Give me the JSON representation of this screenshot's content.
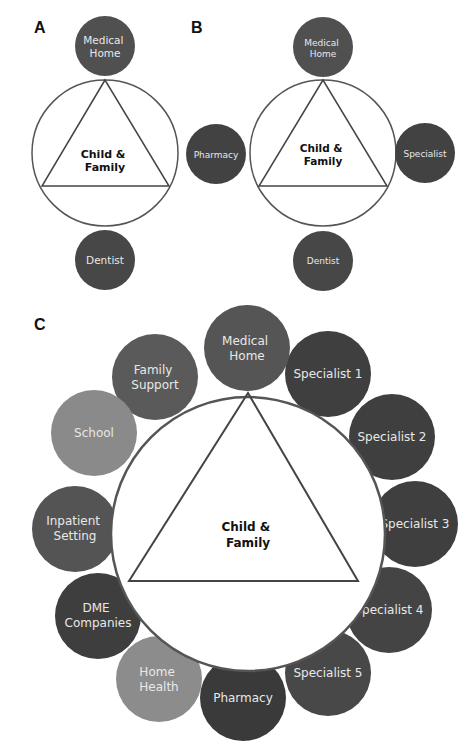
{
  "colors": {
    "dark": "#4a4a4a",
    "darker": "#3d3d3d",
    "medium": "#5e5e5e",
    "light": "#8c8c8c",
    "ring": "#555555",
    "center_fill": "#ffffff"
  },
  "panels": {
    "A": {
      "label": "A",
      "center": "Child & Family",
      "center_lines": [
        "Child &",
        "Family"
      ],
      "nodes": [
        {
          "lines": [
            "Medical",
            "Home"
          ]
        },
        {
          "lines": [
            "Dentist"
          ]
        }
      ]
    },
    "B": {
      "label": "B",
      "center_lines": [
        "Child &",
        "Family"
      ],
      "nodes": [
        {
          "lines": [
            "Medical",
            "Home"
          ]
        },
        {
          "lines": [
            "Pharmacy"
          ]
        },
        {
          "lines": [
            "Specialist"
          ]
        },
        {
          "lines": [
            "Dentist"
          ]
        }
      ]
    },
    "C": {
      "label": "C",
      "center_lines": [
        "Child &",
        "Family"
      ],
      "nodes": [
        {
          "lines": [
            "Medical",
            "Home"
          ]
        },
        {
          "lines": [
            "Specialist 1"
          ]
        },
        {
          "lines": [
            "Specialist 2"
          ]
        },
        {
          "lines": [
            "Specialist 3"
          ]
        },
        {
          "lines": [
            "Specialist 4"
          ]
        },
        {
          "lines": [
            "Specialist 5"
          ]
        },
        {
          "lines": [
            "Pharmacy"
          ]
        },
        {
          "lines": [
            "Home",
            "Health"
          ]
        },
        {
          "lines": [
            "DME",
            "Companies"
          ]
        },
        {
          "lines": [
            "Inpatient",
            "Setting"
          ]
        },
        {
          "lines": [
            "School"
          ]
        },
        {
          "lines": [
            "Family",
            "Support"
          ]
        }
      ]
    }
  }
}
